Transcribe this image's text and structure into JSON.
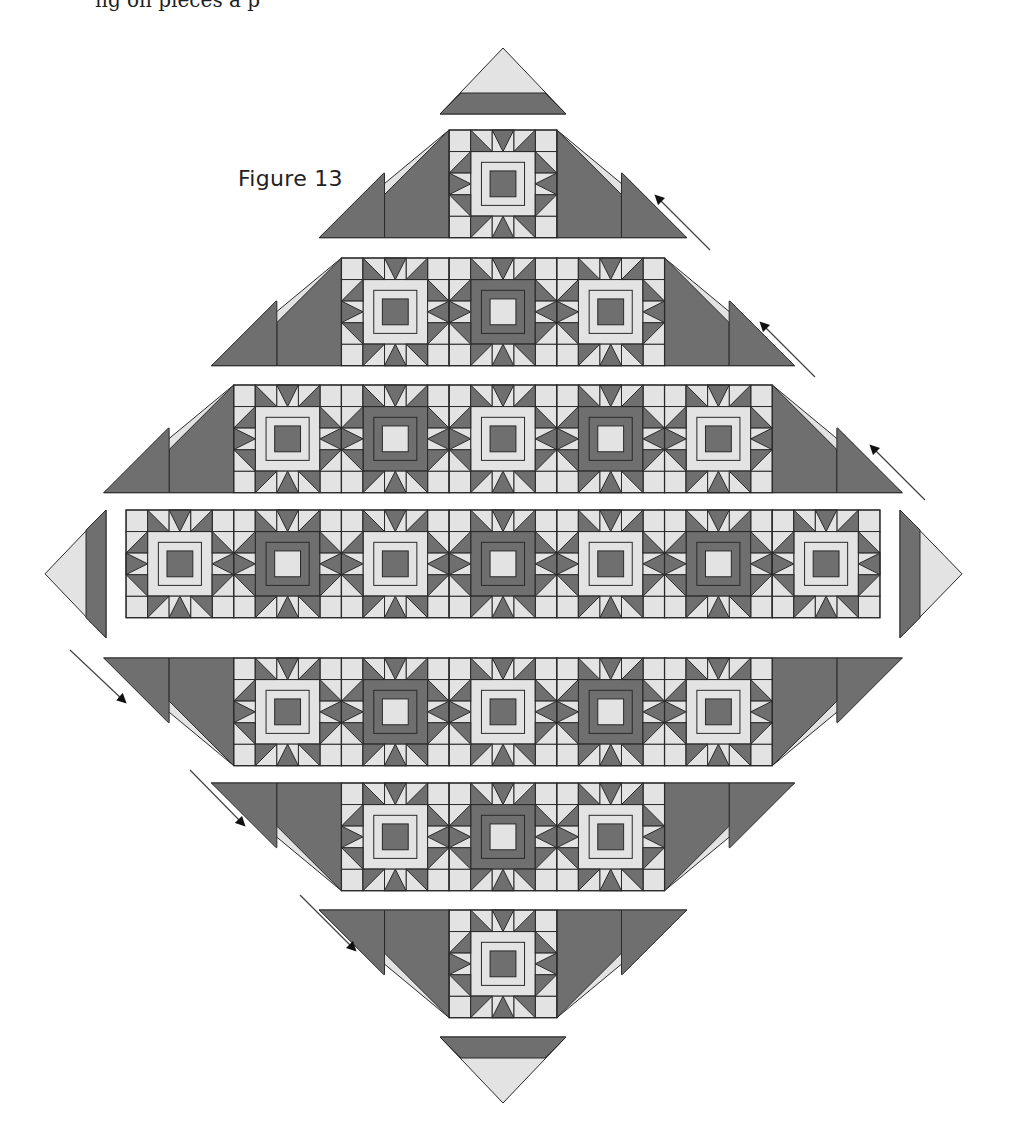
{
  "page": {
    "cropped_top_text": "ng on pieces a    p",
    "figure_label": "Figure 13"
  },
  "colors": {
    "light": "#e3e3e3",
    "dark": "#6f6f6f",
    "line": "#2a2a2a",
    "arrow": "#111111",
    "background": "#ffffff"
  },
  "quilt": {
    "block_size": 107.7,
    "unit": 21.54,
    "center_x": 503,
    "block_types": {
      "A": "dark center square, light ring",
      "B": "light center square, dark ring"
    },
    "rows": [
      {
        "name": "corner-top",
        "kind": "corner",
        "y": 48,
        "pattern": []
      },
      {
        "name": "row-1",
        "y": 130,
        "pattern": [
          "A"
        ]
      },
      {
        "name": "row-2",
        "y": 258,
        "pattern": [
          "A",
          "B",
          "A"
        ]
      },
      {
        "name": "row-3",
        "y": 385,
        "pattern": [
          "A",
          "B",
          "A",
          "B",
          "A"
        ]
      },
      {
        "name": "row-4",
        "y": 510,
        "pattern": [
          "A",
          "B",
          "A",
          "B",
          "A",
          "B",
          "A"
        ]
      },
      {
        "name": "row-5",
        "y": 658,
        "pattern": [
          "A",
          "B",
          "A",
          "B",
          "A"
        ]
      },
      {
        "name": "row-6",
        "y": 783,
        "pattern": [
          "A",
          "B",
          "A"
        ]
      },
      {
        "name": "row-7",
        "y": 910,
        "pattern": [
          "A"
        ]
      },
      {
        "name": "corner-bottom",
        "kind": "corner",
        "y": 1037,
        "pattern": []
      }
    ],
    "side_triangles": [
      {
        "name": "left-side-triangle",
        "x": 45,
        "y": 510
      },
      {
        "name": "right-side-triangle",
        "x": 900,
        "y": 510
      }
    ]
  },
  "arrows": [
    {
      "name": "arrow-up-left-1",
      "x1": 710,
      "y1": 250,
      "x2": 658,
      "y2": 198
    },
    {
      "name": "arrow-up-left-2",
      "x1": 815,
      "y1": 377,
      "x2": 763,
      "y2": 325
    },
    {
      "name": "arrow-up-left-3",
      "x1": 925,
      "y1": 500,
      "x2": 873,
      "y2": 448
    },
    {
      "name": "arrow-down-right-1",
      "x1": 70,
      "y1": 650,
      "x2": 123,
      "y2": 700
    },
    {
      "name": "arrow-down-right-2",
      "x1": 190,
      "y1": 770,
      "x2": 242,
      "y2": 823
    },
    {
      "name": "arrow-down-right-3",
      "x1": 300,
      "y1": 895,
      "x2": 353,
      "y2": 948
    }
  ]
}
